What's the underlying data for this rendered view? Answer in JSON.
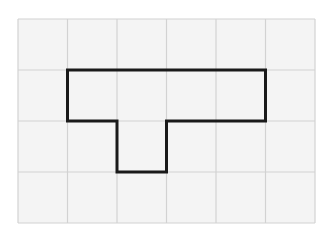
{
  "figure": {
    "canvas": {
      "width": 334,
      "height": 237,
      "background": "#ffffff"
    },
    "grid": {
      "columns": 6,
      "rows": 4,
      "origin_x": 18,
      "origin_y": 19,
      "cell_width": 49.5,
      "cell_height": 51,
      "line_color": "#d2d2d2",
      "cell_fill": "#f4f4f4",
      "line_width": 1.2,
      "x_lines": [
        18,
        67.5,
        117,
        166.5,
        216,
        265.5,
        315
      ],
      "y_lines": [
        19,
        70,
        121,
        172,
        223
      ]
    },
    "shape": {
      "name": "t-shape",
      "stroke_color": "#1a1a1a",
      "stroke_width": 3,
      "fill": "none",
      "area_cells": 4,
      "perimeter_cells": 10,
      "vertices": [
        [
          67.5,
          70
        ],
        [
          265.5,
          70
        ],
        [
          265.5,
          121
        ],
        [
          166.5,
          121
        ],
        [
          166.5,
          172
        ],
        [
          117,
          172
        ],
        [
          117,
          121
        ],
        [
          67.5,
          121
        ]
      ],
      "path": "M 67.5 70 L 265.5 70 L 265.5 121 L 166.5 121 L 166.5 172 L 117 172 L 117 121 L 67.5 121 Z",
      "grid_cells_covered": [
        {
          "col": 1,
          "row": 1
        },
        {
          "col": 2,
          "row": 1
        },
        {
          "col": 3,
          "row": 1
        },
        {
          "col": 4,
          "row": 1
        },
        {
          "col": 2,
          "row": 2
        }
      ]
    }
  }
}
